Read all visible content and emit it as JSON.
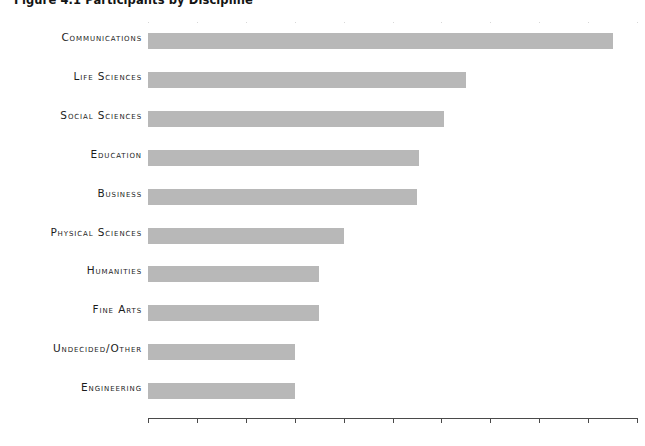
{
  "chart_data": {
    "type": "bar",
    "orientation": "horizontal",
    "title": "Figure 4.1 Participants by Discipline",
    "xlabel": "",
    "ylabel": "",
    "categories": [
      "Communications",
      "Life Sciences",
      "Social Sciences",
      "Education",
      "Business",
      "Physical Sciences",
      "Humanities",
      "Fine Arts",
      "Undecided/Other",
      "Engineering"
    ],
    "values": [
      19.0,
      13.0,
      12.1,
      11.1,
      11.0,
      8.0,
      7.0,
      7.0,
      6.0,
      6.0
    ],
    "value_suffix": "%",
    "xlim": [
      0,
      20
    ],
    "xtick_step": 2,
    "xticks": [
      0,
      2,
      4,
      6,
      8,
      10,
      12,
      14,
      16,
      18,
      20
    ],
    "xtick_labels": [
      "0%",
      "2%",
      "4%",
      "6%",
      "8%",
      "10%",
      "12%",
      "14%",
      "16%",
      "18%",
      "20%"
    ],
    "grid": true,
    "grid_axis": "x",
    "grid_style": "dotted",
    "legend": false,
    "bar_color": "#b8b8b8",
    "grid_color": "#d8d8d8",
    "axis_color": "#4a4a4a",
    "text_color": "#1c1c1c",
    "background_color": "#ffffff"
  }
}
